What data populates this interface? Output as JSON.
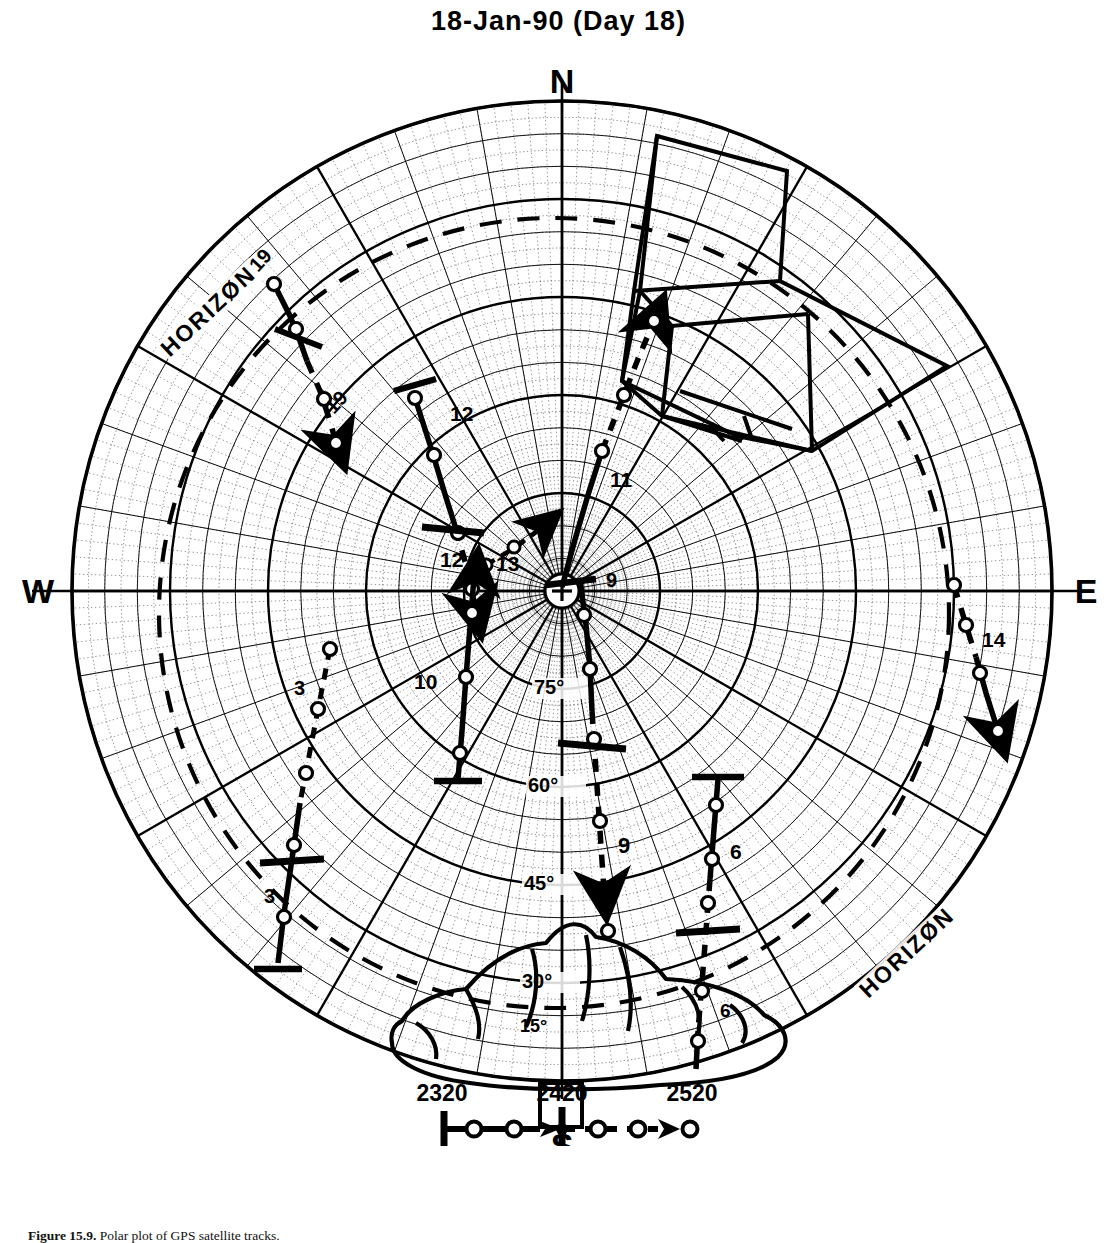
{
  "chart_data": {
    "type": "scatter",
    "title": "18-Jan-90  (Day 18)",
    "subtitle": "",
    "projection": "polar sky plot (azimuth / elevation)",
    "xlabel": "Azimuth",
    "ylabel": "Elevation",
    "grid": true,
    "legend_position": "bottom",
    "cardinal_labels": {
      "north": "N",
      "east": "E",
      "south": "S",
      "west": "W"
    },
    "elevation_ring_labels": [
      "75°",
      "60°",
      "45°",
      "30°",
      "15°"
    ],
    "elevation_ring_values": [
      75,
      60,
      45,
      30,
      15
    ],
    "horizon_label": "HORIZØN",
    "horizon_label_count": 2,
    "center_marker": "plus-in-circle (zenith)",
    "annotations": [
      {
        "label": "19",
        "azimuth_deg": 315,
        "elevation_deg": 14,
        "note": "NW track, labelled at both ends"
      },
      {
        "label": "19",
        "azimuth_deg": 322,
        "elevation_deg": 26
      },
      {
        "label": "12",
        "azimuth_deg": 340,
        "elevation_deg": 42,
        "note": "NNW track upper"
      },
      {
        "label": "12",
        "azimuth_deg": 332,
        "elevation_deg": 63,
        "note": "NNW track near centre"
      },
      {
        "label": "13",
        "azimuth_deg": 350,
        "elevation_deg": 66
      },
      {
        "label": "11",
        "azimuth_deg": 25,
        "elevation_deg": 48,
        "note": "NNE track"
      },
      {
        "label": "14",
        "azimuth_deg": 97,
        "elevation_deg": 22,
        "note": "east track"
      },
      {
        "label": "9",
        "azimuth_deg": 178,
        "elevation_deg": 80,
        "note": "south track upper"
      },
      {
        "label": "9",
        "azimuth_deg": 181,
        "elevation_deg": 40,
        "note": "south track lower"
      },
      {
        "label": "10",
        "azimuth_deg": 246,
        "elevation_deg": 56,
        "note": "WSW track"
      },
      {
        "label": "3",
        "azimuth_deg": 252,
        "elevation_deg": 38,
        "note": "SW track upper"
      },
      {
        "label": "3",
        "azimuth_deg": 232,
        "elevation_deg": 20,
        "note": "SW track lower"
      },
      {
        "label": "6",
        "azimuth_deg": 152,
        "elevation_deg": 35,
        "note": "SSE track upper"
      },
      {
        "label": "6",
        "azimuth_deg": 158,
        "elevation_deg": 14,
        "note": "SSE track lower"
      }
    ],
    "tracks": [
      {
        "id": "19",
        "style": "solid-then-dashed",
        "arrow": true
      },
      {
        "id": "12",
        "style": "solid-then-dashed",
        "arrow": true
      },
      {
        "id": "13",
        "style": "dashed",
        "arrow": true
      },
      {
        "id": "11",
        "style": "solid-then-dashed",
        "arrow": true
      },
      {
        "id": "14",
        "style": "dashed",
        "arrow": true
      },
      {
        "id": "9",
        "style": "solid-then-dashed",
        "arrow": true
      },
      {
        "id": "10",
        "style": "solid",
        "arrow": true
      },
      {
        "id": "3",
        "style": "solid-then-dashed",
        "arrow": true
      },
      {
        "id": "6",
        "style": "solid-then-dashed",
        "arrow": true
      }
    ],
    "overlays": [
      {
        "name": "building-outline",
        "location": "north-east quadrant"
      },
      {
        "name": "terrain-outline",
        "location": "south / horizon"
      }
    ]
  },
  "legend": {
    "ticks": [
      "2320",
      "2420",
      "2520"
    ],
    "description": "time scale along track (HHMM UT), tick at 2420, open circles are sample points, arrow shows direction of motion"
  },
  "caption": {
    "figure_number": "Figure 15.9.",
    "text": "Polar plot of GPS satellite tracks."
  }
}
